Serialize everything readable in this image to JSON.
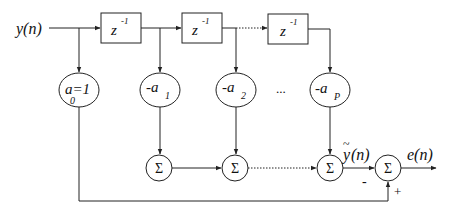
{
  "diagram": {
    "type": "block-diagram",
    "title": "",
    "input": {
      "label": "y(n)"
    },
    "delays": [
      {
        "label_base": "z",
        "label_exp": "-1"
      },
      {
        "label_base": "z",
        "label_exp": "-1"
      },
      {
        "label_base": "z",
        "label_exp": "-1"
      }
    ],
    "coefficients": [
      {
        "label_main": "a=1",
        "label_sub": "0"
      },
      {
        "label_main": "-a",
        "label_sub": "1"
      },
      {
        "label_main": "-a",
        "label_sub": "2"
      },
      {
        "label_main": "-a",
        "label_sub": "P"
      }
    ],
    "ellipsis": "...",
    "summers": [
      {
        "label": "Σ"
      },
      {
        "label": "Σ"
      },
      {
        "label": "Σ"
      },
      {
        "label": "Σ"
      }
    ],
    "prediction": {
      "label_base": "y",
      "label_tilde": "~",
      "label_arg": "(n)"
    },
    "output": {
      "label": "e(n)"
    },
    "signs": {
      "minus": "-",
      "plus": "+"
    },
    "colors": {
      "stroke": "#222222",
      "background": "#ffffff"
    }
  }
}
